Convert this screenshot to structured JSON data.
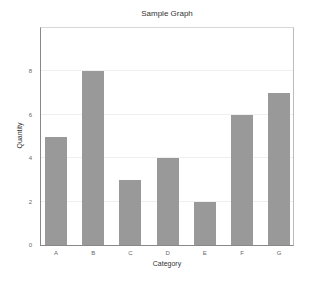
{
  "chart_data": {
    "type": "bar",
    "title": "Sample Graph",
    "xlabel": "Category",
    "ylabel": "Quantity",
    "categories": [
      "A",
      "B",
      "C",
      "D",
      "E",
      "F",
      "G"
    ],
    "values": [
      5,
      8,
      3,
      4,
      2,
      6,
      7
    ],
    "ylim": [
      0,
      10
    ],
    "yticks": [
      0,
      2,
      4,
      6,
      8
    ],
    "grid": true,
    "legend": null,
    "bar_color": "#999999"
  }
}
